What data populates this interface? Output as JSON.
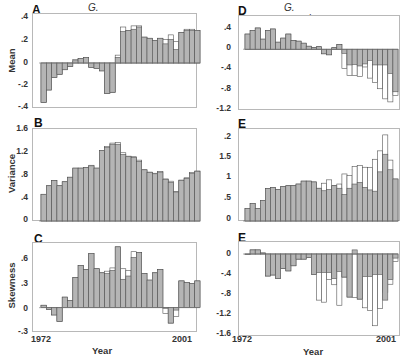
{
  "figure": {
    "left_title": "G. fortis",
    "right_title": "G. scandens",
    "xlabel": "Year",
    "x_start": "1972",
    "x_end": "2001"
  },
  "chart_data": [
    {
      "panel": "A",
      "type": "bar",
      "species": "G. fortis",
      "title": "G. fortis",
      "ylabel": "Mean",
      "xlabel": "",
      "yticks": [
        ".4",
        ".2",
        "0",
        "-.2",
        "-.4"
      ],
      "ylim": [
        -0.4,
        0.4
      ],
      "x": [
        1972,
        1973,
        1974,
        1975,
        1976,
        1977,
        1978,
        1979,
        1980,
        1981,
        1982,
        1983,
        1984,
        1985,
        1986,
        1987,
        1988,
        1989,
        1990,
        1991,
        1992,
        1993,
        1994,
        1995,
        1996,
        1997,
        1998,
        1999,
        2000,
        2001
      ],
      "series": [
        {
          "name": "shaded",
          "values": [
            -0.35,
            -0.24,
            -0.13,
            -0.1,
            -0.06,
            -0.03,
            0.02,
            0.04,
            0.05,
            -0.04,
            -0.05,
            -0.07,
            -0.27,
            -0.26,
            0.05,
            0.28,
            0.29,
            0.3,
            0.32,
            0.23,
            0.22,
            0.2,
            0.22,
            0.17,
            0.21,
            0.12,
            0.27,
            0.29,
            0.29,
            0.29
          ]
        },
        {
          "name": "open",
          "values": [
            -0.35,
            -0.24,
            -0.13,
            -0.1,
            -0.06,
            -0.03,
            0.03,
            0.04,
            0.05,
            -0.04,
            -0.05,
            -0.07,
            -0.27,
            -0.26,
            0.07,
            0.32,
            0.29,
            0.33,
            0.33,
            0.23,
            0.22,
            0.2,
            0.22,
            0.21,
            0.25,
            0.19,
            0.27,
            0.3,
            0.3,
            0.29
          ]
        }
      ]
    },
    {
      "panel": "B",
      "type": "bar",
      "species": "G. fortis",
      "ylabel": "Variance",
      "xlabel": "",
      "yticks": [
        "1.6",
        "1.2",
        ".8",
        ".4",
        "0"
      ],
      "ylim": [
        0,
        1.6
      ],
      "x": [
        1972,
        1973,
        1974,
        1975,
        1976,
        1977,
        1978,
        1979,
        1980,
        1981,
        1982,
        1983,
        1984,
        1985,
        1986,
        1987,
        1988,
        1989,
        1990,
        1991,
        1992,
        1993,
        1994,
        1995,
        1996,
        1997,
        1998,
        1999,
        2000,
        2001
      ],
      "series": [
        {
          "name": "shaded",
          "values": [
            0.47,
            0.62,
            0.71,
            0.62,
            0.69,
            0.77,
            0.93,
            0.93,
            0.94,
            0.97,
            0.93,
            1.24,
            1.29,
            1.35,
            1.35,
            1.17,
            1.13,
            1.12,
            1.05,
            0.9,
            0.85,
            0.83,
            0.86,
            0.73,
            0.68,
            0.51,
            0.71,
            0.75,
            0.84,
            0.87
          ]
        },
        {
          "name": "open",
          "values": [
            0.47,
            0.62,
            0.71,
            0.62,
            0.69,
            0.77,
            0.93,
            0.93,
            0.94,
            0.98,
            0.93,
            1.24,
            1.31,
            1.37,
            1.38,
            1.2,
            1.14,
            1.13,
            1.07,
            0.9,
            0.86,
            0.84,
            0.87,
            0.74,
            0.7,
            0.52,
            0.72,
            0.76,
            0.85,
            0.88
          ]
        }
      ]
    },
    {
      "panel": "C",
      "type": "bar",
      "species": "G. fortis",
      "ylabel": "Skewness",
      "xlabel": "Year",
      "yticks": [
        ".6",
        ".3",
        "0",
        "-.3"
      ],
      "ylim": [
        -0.3,
        0.8
      ],
      "xticks": [
        "1972",
        "2001"
      ],
      "x": [
        1972,
        1973,
        1974,
        1975,
        1976,
        1977,
        1978,
        1979,
        1980,
        1981,
        1982,
        1983,
        1984,
        1985,
        1986,
        1987,
        1988,
        1989,
        1990,
        1991,
        1992,
        1993,
        1994,
        1995,
        1996,
        1997,
        1998,
        1999,
        2000,
        2001
      ],
      "series": [
        {
          "name": "shaded",
          "values": [
            0.03,
            -0.02,
            -0.09,
            -0.17,
            0.13,
            0.09,
            0.37,
            0.52,
            0.47,
            0.67,
            0.48,
            0.43,
            0.42,
            0.46,
            0.75,
            0.35,
            0.39,
            0.62,
            0.68,
            0.42,
            0.34,
            0.43,
            0.47,
            0.0,
            -0.19,
            -0.03,
            0.33,
            0.31,
            0.3,
            0.33
          ]
        },
        {
          "name": "open",
          "values": [
            0.03,
            -0.02,
            -0.09,
            -0.17,
            0.13,
            0.09,
            0.37,
            0.52,
            0.47,
            0.67,
            0.48,
            0.43,
            0.45,
            0.49,
            0.75,
            0.48,
            0.46,
            0.69,
            0.68,
            0.42,
            0.34,
            0.43,
            0.47,
            -0.07,
            -0.19,
            -0.11,
            0.33,
            0.31,
            0.3,
            0.33
          ]
        }
      ]
    },
    {
      "panel": "D",
      "type": "bar",
      "species": "G. scandens",
      "title": "G. scandens",
      "ylabel": "",
      "xlabel": "",
      "yticks": [
        ".4",
        "0",
        "-.4",
        "-.8",
        "-1.2"
      ],
      "ylim": [
        -1.2,
        0.5
      ],
      "x": [
        1972,
        1973,
        1974,
        1975,
        1976,
        1977,
        1978,
        1979,
        1980,
        1981,
        1982,
        1983,
        1984,
        1985,
        1986,
        1987,
        1988,
        1989,
        1990,
        1991,
        1992,
        1993,
        1994,
        1995,
        1996,
        1997,
        1998,
        1999,
        2000,
        2001
      ],
      "series": [
        {
          "name": "shaded",
          "values": [
            0.3,
            0.37,
            0.42,
            0.2,
            0.37,
            0.4,
            0.14,
            0.22,
            0.3,
            0.17,
            0.16,
            0.12,
            0.06,
            0.03,
            0.05,
            -0.09,
            -0.11,
            0.03,
            0.09,
            -0.08,
            -0.31,
            -0.3,
            -0.33,
            -0.29,
            -0.22,
            -0.31,
            -0.31,
            -0.31,
            -0.48,
            -0.84
          ]
        },
        {
          "name": "open",
          "values": [
            0.3,
            0.37,
            0.42,
            0.2,
            0.37,
            0.4,
            0.14,
            0.22,
            0.3,
            0.17,
            0.16,
            0.12,
            0.06,
            0.03,
            0.05,
            -0.09,
            -0.11,
            0.03,
            0.09,
            -0.38,
            -0.52,
            -0.52,
            -0.54,
            -0.35,
            -0.57,
            -0.66,
            -0.78,
            -0.98,
            -1.04,
            -0.91
          ]
        }
      ]
    },
    {
      "panel": "E",
      "type": "bar",
      "species": "G. scandens",
      "ylabel": "",
      "xlabel": "",
      "yticks": [
        ".2",
        "1.5",
        "1",
        ".5",
        "0"
      ],
      "ylim": [
        0,
        2.1
      ],
      "x": [
        1972,
        1973,
        1974,
        1975,
        1976,
        1977,
        1978,
        1979,
        1980,
        1981,
        1982,
        1983,
        1984,
        1985,
        1986,
        1987,
        1988,
        1989,
        1990,
        1991,
        1992,
        1993,
        1994,
        1995,
        1996,
        1997,
        1998,
        1999,
        2000,
        2001
      ],
      "series": [
        {
          "name": "shaded",
          "values": [
            0.3,
            0.42,
            0.3,
            0.49,
            0.77,
            0.8,
            0.75,
            0.82,
            0.84,
            0.84,
            0.88,
            0.95,
            0.95,
            0.93,
            0.78,
            0.72,
            0.75,
            0.84,
            0.78,
            0.63,
            0.78,
            0.88,
            0.92,
            0.8,
            0.74,
            0.71,
            1.17,
            1.59,
            1.22,
            1.0
          ]
        },
        {
          "name": "open",
          "values": [
            0.3,
            0.42,
            0.3,
            0.49,
            0.77,
            0.8,
            0.75,
            0.82,
            0.84,
            0.84,
            0.88,
            0.95,
            0.95,
            0.93,
            0.78,
            0.9,
            0.98,
            0.84,
            0.88,
            1.12,
            1.08,
            1.3,
            1.32,
            1.28,
            1.27,
            1.47,
            1.67,
            2.05,
            1.45,
            1.0
          ]
        }
      ]
    },
    {
      "panel": "E",
      "type": "bar",
      "species": "G. scandens",
      "ylabel": "",
      "xlabel": "Year",
      "yticks": [
        "0",
        "-.4",
        "-.8",
        "-1.2",
        "-1.6"
      ],
      "ylim": [
        -1.6,
        0.2
      ],
      "xticks": [
        "1972",
        "2001"
      ],
      "x": [
        1972,
        1973,
        1974,
        1975,
        1976,
        1977,
        1978,
        1979,
        1980,
        1981,
        1982,
        1983,
        1984,
        1985,
        1986,
        1987,
        1988,
        1989,
        1990,
        1991,
        1992,
        1993,
        1994,
        1995,
        1996,
        1997,
        1998,
        1999,
        2000,
        2001
      ],
      "series": [
        {
          "name": "shaded",
          "values": [
            0.0,
            0.08,
            0.08,
            0.02,
            -0.43,
            -0.41,
            -0.48,
            -0.28,
            -0.33,
            -0.23,
            -0.1,
            -0.1,
            -0.07,
            -0.4,
            -0.36,
            -0.36,
            -0.36,
            -0.48,
            -0.34,
            -0.45,
            -0.84,
            0.08,
            -0.88,
            -0.44,
            -0.44,
            -0.4,
            -0.4,
            -0.9,
            -0.5,
            -0.08
          ]
        },
        {
          "name": "open",
          "values": [
            0.0,
            0.08,
            0.08,
            0.02,
            -0.43,
            -0.41,
            -0.48,
            -0.28,
            -0.33,
            -0.23,
            -0.1,
            -0.1,
            -0.07,
            -0.4,
            -0.9,
            -0.94,
            -0.5,
            -0.6,
            -1.0,
            -0.45,
            -0.84,
            -0.85,
            -0.88,
            -1.05,
            -1.1,
            -1.4,
            -1.06,
            -0.75,
            -0.59,
            -0.15
          ]
        }
      ]
    }
  ],
  "colors": {
    "shaded": "#b5b5b5",
    "open": "#ffffff",
    "edge": "#555555",
    "frame": "#b8b8b8"
  }
}
